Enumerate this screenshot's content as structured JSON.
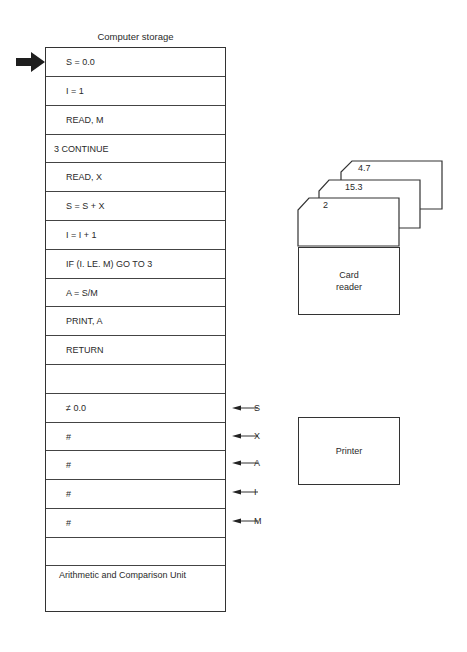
{
  "diagram": {
    "storage": {
      "title": "Computer storage",
      "rows": [
        {
          "text": "S = 0.0",
          "indent": true
        },
        {
          "text": "I = 1",
          "indent": true
        },
        {
          "text": "READ, M",
          "indent": true
        },
        {
          "text": "3 CONTINUE",
          "indent": false
        },
        {
          "text": "READ, X",
          "indent": true
        },
        {
          "text": "S = S + X",
          "indent": true
        },
        {
          "text": "I = I + 1",
          "indent": true
        },
        {
          "text": "IF (I. LE. M) GO TO 3",
          "indent": true
        },
        {
          "text": "A = S/M",
          "indent": true
        },
        {
          "text": "PRINT, A",
          "indent": true
        },
        {
          "text": "RETURN",
          "indent": true
        },
        {
          "text": "",
          "indent": true
        },
        {
          "text": "≠ 0.0",
          "indent": true
        },
        {
          "text": "#",
          "indent": true
        },
        {
          "text": "#",
          "indent": true
        },
        {
          "text": "#",
          "indent": true
        },
        {
          "text": "#",
          "indent": true
        },
        {
          "text": "",
          "indent": true
        }
      ],
      "alu_label": "Arithmetic and Comparison Unit",
      "current_instruction_pointer": "S = 0.0"
    },
    "variable_pointers": [
      {
        "label": "S",
        "row": 12
      },
      {
        "label": "X",
        "row": 13
      },
      {
        "label": "A",
        "row": 14
      },
      {
        "label": "I",
        "row": 15
      },
      {
        "label": "M",
        "row": 16
      }
    ],
    "cards": [
      {
        "value": "2"
      },
      {
        "value": "15.3"
      },
      {
        "value": "4.7"
      }
    ],
    "card_reader": {
      "label_line1": "Card",
      "label_line2": "reader"
    },
    "printer": {
      "label": "Printer"
    }
  }
}
